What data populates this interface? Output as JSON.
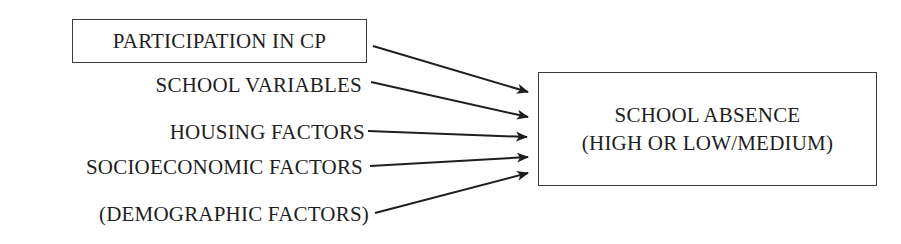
{
  "diagram": {
    "type": "causal-flow",
    "predictors": [
      {
        "id": "cp",
        "label": "PARTICIPATION IN CP",
        "boxed": true
      },
      {
        "id": "school",
        "label": "SCHOOL VARIABLES",
        "boxed": false
      },
      {
        "id": "housing",
        "label": "HOUSING FACTORS",
        "boxed": false
      },
      {
        "id": "socio",
        "label": "SOCIOECONOMIC FACTORS",
        "boxed": false
      },
      {
        "id": "demo",
        "label": "(DEMOGRAPHIC FACTORS)",
        "boxed": false
      }
    ],
    "outcome": {
      "line1": "SCHOOL ABSENCE",
      "line2": "(HIGH OR LOW/MEDIUM)"
    },
    "edges": [
      {
        "from": "cp",
        "to": "outcome"
      },
      {
        "from": "school",
        "to": "outcome"
      },
      {
        "from": "housing",
        "to": "outcome"
      },
      {
        "from": "socio",
        "to": "outcome"
      },
      {
        "from": "demo",
        "to": "outcome"
      }
    ],
    "colors": {
      "line": "#1e1e1e",
      "box_border": "#3a3a3a",
      "background": "#ffffff"
    }
  }
}
